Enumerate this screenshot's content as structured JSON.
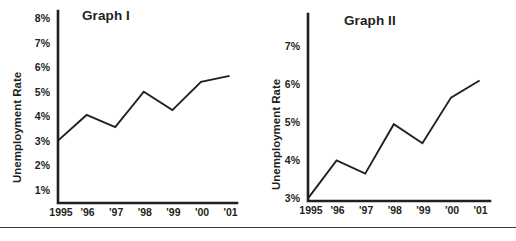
{
  "figure": {
    "divider_label": "footer-rule",
    "accent_color": "#231f20",
    "background_color": "#ffffff"
  },
  "chart_data": [
    {
      "id": "graph-1",
      "type": "line",
      "title": "Graph I",
      "xlabel": "",
      "ylabel": "Unemployment Rate",
      "categories": [
        "1995",
        "'96",
        "'97",
        "'98",
        "'99",
        "'00",
        "'01"
      ],
      "x": [
        1995,
        1996,
        1997,
        1998,
        1999,
        2000,
        2001
      ],
      "values": [
        3.0,
        4.05,
        3.55,
        5.0,
        4.25,
        5.4,
        5.65
      ],
      "ylim": [
        0,
        8
      ],
      "yticks": [
        1,
        2,
        3,
        4,
        5,
        6,
        7,
        8
      ],
      "ytick_labels": [
        "1%",
        "2%",
        "3%",
        "4%",
        "5%",
        "6%",
        "7%",
        "8%"
      ],
      "grid": false,
      "legend": "none"
    },
    {
      "id": "graph-2",
      "type": "line",
      "title": "Graph II",
      "xlabel": "",
      "ylabel": "Unemployment Rate",
      "categories": [
        "1995",
        "'96",
        "'97",
        "'98",
        "'99",
        "'00",
        "'01"
      ],
      "x": [
        1995,
        1996,
        1997,
        1998,
        1999,
        2000,
        2001
      ],
      "values": [
        3.0,
        4.0,
        3.65,
        4.95,
        4.45,
        5.65,
        6.1
      ],
      "ylim": [
        3,
        7.8
      ],
      "yticks": [
        3,
        4,
        5,
        6,
        7
      ],
      "ytick_labels": [
        "3%",
        "4%",
        "5%",
        "6%",
        "7%"
      ],
      "grid": false,
      "legend": "none"
    }
  ]
}
